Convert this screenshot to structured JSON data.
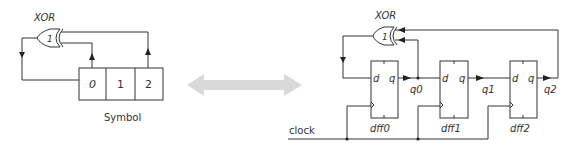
{
  "left_diagram": {
    "gate_label": "XOR",
    "gate_symbol": "1",
    "register_cells": [
      "0",
      "1",
      "2"
    ],
    "caption": "Symbol"
  },
  "center_arrow": {
    "type": "double-headed-arrow",
    "color": "#d9d9d9"
  },
  "right_diagram": {
    "gate_label": "XOR",
    "gate_symbol": "1",
    "clock_label": "clock",
    "flip_flops": [
      {
        "name": "dff0",
        "d_label": "d",
        "q_label": "q",
        "output": "q0"
      },
      {
        "name": "dff1",
        "d_label": "d",
        "q_label": "q",
        "output": "q1"
      },
      {
        "name": "dff2",
        "d_label": "d",
        "q_label": "q",
        "output": "q2"
      }
    ]
  },
  "colors": {
    "line": "#333333",
    "arrow": "#d9d9d9",
    "background": "#ffffff"
  }
}
